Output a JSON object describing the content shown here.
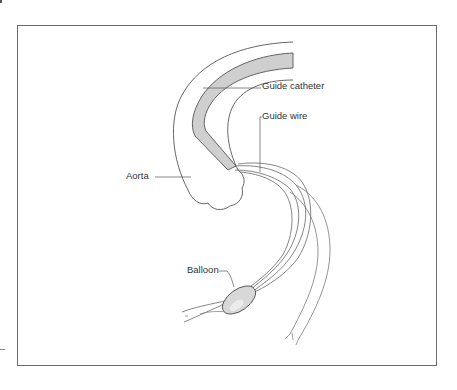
{
  "figure": {
    "type": "medical-illustration",
    "labels": {
      "guide_catheter": "Guide catheter",
      "guide_wire": "Guide wire",
      "aorta": "Aorta",
      "balloon": "Balloon"
    },
    "colors": {
      "frame": "#6b6b6b",
      "line": "#555555",
      "catheter_fill": "#cfcfcf",
      "balloon_fill": "#d8d8d8",
      "background": "#ffffff"
    }
  }
}
